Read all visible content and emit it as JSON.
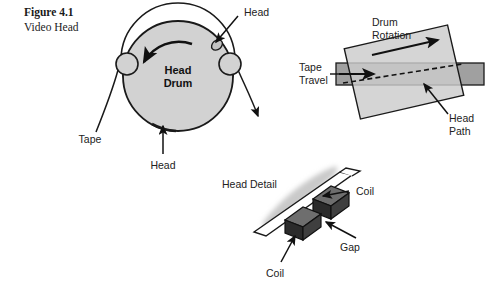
{
  "figure": {
    "caption_line1": "Figure 4.1",
    "caption_line2": "Video Head"
  },
  "colors": {
    "background": "#ffffff",
    "drum_fill": "#d2d2d2",
    "drum_stroke": "#1a1a1a",
    "tape_band_fill": "#a0a0a0",
    "drum_rect_fill": "#cccccc",
    "coil_dark": "#2b2b2b",
    "coil_mid": "#4a4a4a",
    "coil_light": "#6e6e6e",
    "smudge": "#c9c9c9",
    "text": "#222222"
  },
  "panel_drum": {
    "name": "head-drum-panel",
    "center_label_line1": "Head",
    "center_label_line2": "Drum",
    "label_head_top": "Head",
    "label_head_bottom": "Head",
    "label_tape": "Tape",
    "rotation_direction": "counter-clockwise"
  },
  "panel_rotation": {
    "name": "drum-rotation-panel",
    "label_drum_rotation_line1": "Drum",
    "label_drum_rotation_line2": "Rotation",
    "label_tape_travel_line1": "Tape",
    "label_tape_travel_line2": "Travel",
    "label_head_path_line1": "Head",
    "label_head_path_line2": "Path",
    "drum_tilt_degrees": -13
  },
  "panel_head_detail": {
    "name": "head-detail-panel",
    "title": "Head Detail",
    "label_coil_upper": "Coil",
    "label_coil_lower": "Coil",
    "label_gap": "Gap"
  }
}
